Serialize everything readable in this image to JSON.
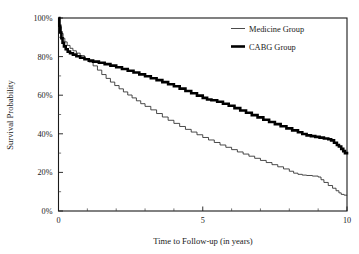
{
  "chart_data": {
    "type": "line",
    "title": "",
    "xlabel": "Time to Follow-up (in years)",
    "ylabel": "Survival Probability",
    "xlim": [
      0,
      10
    ],
    "ylim": [
      0,
      1
    ],
    "grid": false,
    "legend_position": "top-right",
    "x_tick_labels": [
      "0",
      "5",
      "10"
    ],
    "x_tick_values": [
      0,
      5,
      10
    ],
    "x_minor_ticks": [
      1,
      2,
      3,
      4,
      6,
      7,
      8,
      9
    ],
    "y_tick_labels": [
      "0%",
      "20%",
      "40%",
      "60%",
      "80%",
      "100%"
    ],
    "y_tick_values": [
      0,
      0.2,
      0.4,
      0.6,
      0.8,
      1.0
    ],
    "y_minor_ticks": [
      0.1,
      0.3,
      0.5,
      0.7,
      0.9
    ],
    "series": [
      {
        "name": "Medicine Group",
        "style": "thin",
        "points": [
          [
            0.0,
            1.0
          ],
          [
            0.05,
            0.955
          ],
          [
            0.1,
            0.92
          ],
          [
            0.16,
            0.895
          ],
          [
            0.22,
            0.876
          ],
          [
            0.3,
            0.858
          ],
          [
            0.4,
            0.843
          ],
          [
            0.5,
            0.83
          ],
          [
            0.62,
            0.818
          ],
          [
            0.75,
            0.805
          ],
          [
            0.9,
            0.79
          ],
          [
            1.05,
            0.772
          ],
          [
            1.2,
            0.752
          ],
          [
            1.35,
            0.73
          ],
          [
            1.5,
            0.707
          ],
          [
            1.65,
            0.687
          ],
          [
            1.8,
            0.668
          ],
          [
            1.95,
            0.65
          ],
          [
            2.1,
            0.633
          ],
          [
            2.25,
            0.617
          ],
          [
            2.4,
            0.601
          ],
          [
            2.55,
            0.586
          ],
          [
            2.7,
            0.571
          ],
          [
            2.85,
            0.556
          ],
          [
            3.0,
            0.542
          ],
          [
            3.2,
            0.524
          ],
          [
            3.4,
            0.505
          ],
          [
            3.6,
            0.487
          ],
          [
            3.8,
            0.47
          ],
          [
            4.0,
            0.454
          ],
          [
            4.2,
            0.438
          ],
          [
            4.4,
            0.423
          ],
          [
            4.6,
            0.409
          ],
          [
            4.8,
            0.395
          ],
          [
            5.0,
            0.381
          ],
          [
            5.2,
            0.368
          ],
          [
            5.4,
            0.355
          ],
          [
            5.6,
            0.342
          ],
          [
            5.8,
            0.33
          ],
          [
            6.0,
            0.318
          ],
          [
            6.2,
            0.306
          ],
          [
            6.4,
            0.295
          ],
          [
            6.6,
            0.284
          ],
          [
            6.8,
            0.273
          ],
          [
            7.0,
            0.262
          ],
          [
            7.2,
            0.251
          ],
          [
            7.4,
            0.24
          ],
          [
            7.6,
            0.229
          ],
          [
            7.8,
            0.218
          ],
          [
            8.0,
            0.206
          ],
          [
            8.15,
            0.196
          ],
          [
            8.3,
            0.19
          ],
          [
            8.45,
            0.186
          ],
          [
            8.6,
            0.184
          ],
          [
            8.8,
            0.181
          ],
          [
            9.0,
            0.176
          ],
          [
            9.1,
            0.162
          ],
          [
            9.2,
            0.148
          ],
          [
            9.35,
            0.132
          ],
          [
            9.5,
            0.118
          ],
          [
            9.62,
            0.105
          ],
          [
            9.72,
            0.094
          ],
          [
            9.8,
            0.086
          ],
          [
            9.9,
            0.082
          ],
          [
            10.0,
            0.081
          ]
        ]
      },
      {
        "name": "CABG Group",
        "style": "thick",
        "points": [
          [
            0.0,
            1.0
          ],
          [
            0.03,
            0.96
          ],
          [
            0.06,
            0.925
          ],
          [
            0.1,
            0.895
          ],
          [
            0.14,
            0.872
          ],
          [
            0.19,
            0.853
          ],
          [
            0.25,
            0.838
          ],
          [
            0.32,
            0.826
          ],
          [
            0.4,
            0.817
          ],
          [
            0.5,
            0.81
          ],
          [
            0.62,
            0.802
          ],
          [
            0.75,
            0.794
          ],
          [
            0.9,
            0.786
          ],
          [
            1.05,
            0.779
          ],
          [
            1.2,
            0.774
          ],
          [
            1.4,
            0.768
          ],
          [
            1.6,
            0.761
          ],
          [
            1.8,
            0.753
          ],
          [
            2.0,
            0.745
          ],
          [
            2.2,
            0.736
          ],
          [
            2.4,
            0.727
          ],
          [
            2.6,
            0.718
          ],
          [
            2.8,
            0.708
          ],
          [
            3.0,
            0.698
          ],
          [
            3.2,
            0.688
          ],
          [
            3.4,
            0.678
          ],
          [
            3.6,
            0.668
          ],
          [
            3.8,
            0.657
          ],
          [
            4.0,
            0.646
          ],
          [
            4.2,
            0.634
          ],
          [
            4.4,
            0.622
          ],
          [
            4.6,
            0.61
          ],
          [
            4.8,
            0.598
          ],
          [
            5.0,
            0.586
          ],
          [
            5.15,
            0.578
          ],
          [
            5.3,
            0.574
          ],
          [
            5.5,
            0.566
          ],
          [
            5.7,
            0.556
          ],
          [
            5.9,
            0.545
          ],
          [
            6.1,
            0.533
          ],
          [
            6.3,
            0.521
          ],
          [
            6.5,
            0.509
          ],
          [
            6.7,
            0.497
          ],
          [
            6.9,
            0.485
          ],
          [
            7.1,
            0.473
          ],
          [
            7.3,
            0.461
          ],
          [
            7.5,
            0.45
          ],
          [
            7.7,
            0.439
          ],
          [
            7.9,
            0.428
          ],
          [
            8.1,
            0.418
          ],
          [
            8.3,
            0.408
          ],
          [
            8.45,
            0.399
          ],
          [
            8.6,
            0.392
          ],
          [
            8.75,
            0.388
          ],
          [
            8.9,
            0.384
          ],
          [
            9.05,
            0.38
          ],
          [
            9.2,
            0.376
          ],
          [
            9.35,
            0.372
          ],
          [
            9.45,
            0.366
          ],
          [
            9.55,
            0.354
          ],
          [
            9.65,
            0.342
          ],
          [
            9.72,
            0.334
          ],
          [
            9.8,
            0.322
          ],
          [
            9.87,
            0.31
          ],
          [
            9.93,
            0.3
          ],
          [
            10.0,
            0.293
          ]
        ]
      }
    ]
  },
  "legend": {
    "items": [
      {
        "label": "Medicine Group",
        "style": "thin"
      },
      {
        "label": "CABG Group",
        "style": "thick"
      }
    ]
  }
}
